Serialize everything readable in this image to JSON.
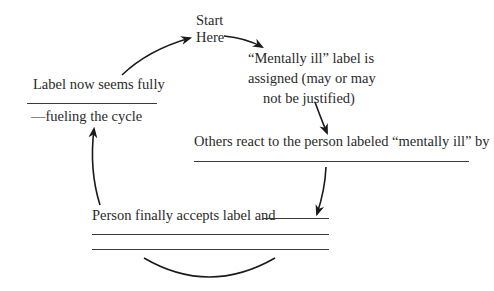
{
  "diagram": {
    "type": "cycle",
    "start": {
      "line1": "Start",
      "line2": "Here"
    },
    "nodes": [
      {
        "id": "assigned",
        "lines": [
          "“Mentally ill” label is",
          "assigned (may or may",
          "not be justified)"
        ]
      },
      {
        "id": "others_react",
        "text": "Others react to the person labeled “mentally ill” by",
        "blank_lines": 1
      },
      {
        "id": "accepts",
        "text": "Person finally accepts label and",
        "blank_lines": 2
      },
      {
        "id": "label_seems",
        "text": "Label now seems fully",
        "continuation": "—fueling the cycle",
        "blank_lines": 1
      }
    ],
    "edges": [
      {
        "from": "label_seems",
        "to": "start"
      },
      {
        "from": "start",
        "to": "assigned"
      },
      {
        "from": "assigned",
        "to": "others_react"
      },
      {
        "from": "others_react",
        "to": "accepts"
      },
      {
        "from": "accepts",
        "to": "label_seems"
      }
    ],
    "colors": {
      "ink": "#2a2a2a",
      "rule": "#3a3a3a",
      "background": "#ffffff"
    }
  }
}
